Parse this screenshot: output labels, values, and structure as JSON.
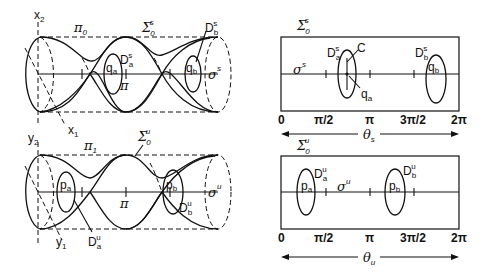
{
  "figure": {
    "top_left_cylinder": {
      "axis_vertical": {
        "base": "x",
        "sub": "2"
      },
      "axis_diag": {
        "base": "x",
        "sub": "1"
      },
      "plane_label": {
        "base": "π",
        "sub": "0"
      },
      "surface_label": {
        "base": "Σ",
        "sub": "0",
        "sup": "s"
      },
      "curve_label": {
        "base": "σ",
        "sup": "s"
      },
      "pi_tick_label": "π",
      "disk_a": {
        "base": "D",
        "sub": "a",
        "sup": "s"
      },
      "disk_b": {
        "base": "D",
        "sub": "b",
        "sup": "s"
      },
      "point_a": {
        "base": "q",
        "sub": "a"
      },
      "point_b": {
        "base": "q",
        "sub": "b"
      }
    },
    "bottom_left_cylinder": {
      "axis_vertical": {
        "base": "y",
        "sub": "2"
      },
      "axis_diag": {
        "base": "y",
        "sub": "1"
      },
      "plane_label": {
        "base": "π",
        "sub": "1"
      },
      "surface_label": {
        "base": "Σ",
        "sub": "0",
        "sup": "u"
      },
      "curve_label": {
        "base": "σ",
        "sup": "u"
      },
      "pi_tick_label": "π",
      "disk_a": {
        "base": "D",
        "sub": "a",
        "sup": "u"
      },
      "disk_b": {
        "base": "D",
        "sub": "b",
        "sup": "u"
      },
      "point_a": {
        "base": "p",
        "sub": "a"
      },
      "point_b": {
        "base": "p",
        "sub": "b"
      }
    },
    "top_right_rect": {
      "surface_label": {
        "base": "Σ",
        "sub": "0",
        "sup": "s"
      },
      "curve_label": {
        "base": "σ",
        "sup": "s"
      },
      "disk_a": {
        "base": "D",
        "sub": "a",
        "sup": "s"
      },
      "disk_b": {
        "base": "D",
        "sub": "b",
        "sup": "s"
      },
      "point_a": {
        "base": "q",
        "sub": "a"
      },
      "point_b": {
        "base": "q",
        "sub": "b"
      },
      "curve_c": "C",
      "ticks": [
        "0",
        "π/2",
        "π",
        "3π/2",
        "2π"
      ],
      "axis_arrow": {
        "base": "θ",
        "sub": "s"
      }
    },
    "bottom_right_rect": {
      "surface_label": {
        "base": "Σ",
        "sub": "0",
        "sup": "u"
      },
      "curve_label": {
        "base": "σ",
        "sup": "u"
      },
      "disk_a": {
        "base": "D",
        "sub": "a",
        "sup": "u"
      },
      "disk_b": {
        "base": "D",
        "sub": "b",
        "sup": "u"
      },
      "point_a": {
        "base": "p",
        "sub": "a"
      },
      "point_b": {
        "base": "p",
        "sub": "b"
      },
      "ticks": [
        "0",
        "π/2",
        "π",
        "3π/2",
        "2π"
      ],
      "axis_arrow": {
        "base": "θ",
        "sub": "u"
      }
    }
  }
}
